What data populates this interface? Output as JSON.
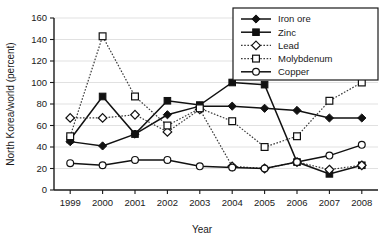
{
  "chart_data": {
    "type": "line",
    "title": "",
    "xlabel": "Year",
    "ylabel": "North Korea/world (percent)",
    "categories": [
      "1999",
      "2000",
      "2001",
      "2002",
      "2003",
      "2004",
      "2005",
      "2006",
      "2007",
      "2008"
    ],
    "x": [
      1999,
      2000,
      2001,
      2002,
      2003,
      2004,
      2005,
      2006,
      2007,
      2008
    ],
    "xlim": [
      1999,
      2008
    ],
    "ylim": [
      0,
      160
    ],
    "yticks": [
      0,
      20,
      40,
      60,
      80,
      100,
      120,
      140,
      160
    ],
    "ytick_labels": [
      "0",
      "20",
      "40",
      "60",
      "80",
      "100",
      "120",
      "140",
      "160"
    ],
    "grid": true,
    "legend_position": "top-right",
    "series": [
      {
        "name": "Iron ore",
        "marker": "filled-diamond",
        "line_style": "solid",
        "color": "#111111",
        "values": [
          45,
          41,
          52,
          70,
          78,
          78,
          76,
          74,
          67,
          67
        ]
      },
      {
        "name": "Zinc",
        "marker": "filled-square",
        "line_style": "solid",
        "color": "#111111",
        "values": [
          47,
          87,
          52,
          83,
          79,
          100,
          98,
          26,
          15,
          23
        ]
      },
      {
        "name": "Lead",
        "marker": "open-diamond",
        "line_style": "dotted",
        "color": "#3a3a3a",
        "values": [
          67,
          67,
          70,
          54,
          75,
          22,
          20,
          26,
          19,
          23
        ]
      },
      {
        "name": "Molybdenum",
        "marker": "open-square",
        "line_style": "dotted",
        "color": "#3a3a3a",
        "values": [
          50,
          143,
          87,
          60,
          76,
          64,
          40,
          50,
          83,
          100
        ]
      },
      {
        "name": "Copper",
        "marker": "open-circle",
        "line_style": "solid",
        "color": "#111111",
        "values": [
          25,
          23,
          28,
          28,
          22,
          21,
          20,
          26,
          32,
          42
        ]
      }
    ]
  },
  "legend": {
    "items": [
      {
        "label": "Iron ore"
      },
      {
        "label": "Zinc"
      },
      {
        "label": "Lead"
      },
      {
        "label": "Molybdenum"
      },
      {
        "label": "Copper"
      }
    ]
  },
  "axes": {
    "y_title": "North Korea/world (percent)",
    "x_title": "Year"
  }
}
